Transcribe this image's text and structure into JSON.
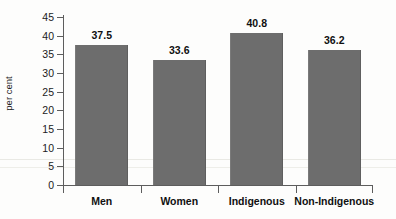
{
  "chart_data": {
    "type": "bar",
    "title": "",
    "xlabel": "",
    "ylabel": "per cent",
    "categories": [
      "Men",
      "Women",
      "Indigenous",
      "Non-Indigenous"
    ],
    "values": [
      37.5,
      33.6,
      40.8,
      36.2
    ],
    "value_labels": [
      "37.5",
      "33.6",
      "40.8",
      "36.2"
    ],
    "ylim": [
      0,
      45
    ],
    "ytick_step": 5,
    "ytick_labels": [
      "0",
      "5",
      "10",
      "15",
      "20",
      "25",
      "30",
      "35",
      "40",
      "45"
    ],
    "grid": false,
    "legend": null,
    "bar_color": "#6d6d6d",
    "axis_color": "#5d5d5d",
    "text_color": "#101010",
    "background": "#fdfdfc"
  }
}
